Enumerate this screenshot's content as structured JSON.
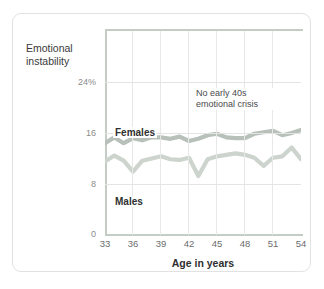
{
  "chart_data": {
    "type": "line",
    "title": "",
    "subtitle": "",
    "xlabel": "Age in years",
    "ylabel": "Emotional\ninstability",
    "ylabel_line1": "Emotional",
    "ylabel_line2": "instability",
    "xlim": [
      33,
      54
    ],
    "ylim": [
      0,
      28
    ],
    "grid": true,
    "legend_position": "inline-labels",
    "x_ticks": [
      33,
      36,
      39,
      42,
      45,
      48,
      51,
      54
    ],
    "x_tick_labels": [
      "33",
      "36",
      "39",
      "42",
      "45",
      "48",
      "51",
      "54"
    ],
    "y_ticks": [
      0,
      8,
      16,
      24
    ],
    "y_tick_labels": [
      "0",
      "8",
      "16",
      "24%"
    ],
    "annotations": [
      {
        "text": "No early 40s\nemotional crisis",
        "line1": "No early 40s",
        "line2": "emotional crisis",
        "x": 45.5,
        "y": 20
      }
    ],
    "x": [
      33,
      34,
      35,
      36,
      37,
      38,
      39,
      40,
      41,
      42,
      43,
      44,
      45,
      46,
      47,
      48,
      49,
      50,
      51,
      52,
      53,
      54
    ],
    "series": [
      {
        "name": "Females",
        "color": "#b7c1ba",
        "values": [
          12.6,
          13.4,
          12.6,
          13.3,
          13.0,
          13.4,
          13.4,
          13.2,
          13.5,
          12.9,
          13.2,
          13.7,
          13.9,
          13.4,
          13.3,
          13.3,
          13.9,
          14.1,
          14.3,
          13.7,
          14.0,
          14.4
        ]
      },
      {
        "name": "Males",
        "color": "#ccd4cd",
        "values": [
          10.1,
          10.9,
          10.2,
          8.7,
          10.2,
          10.5,
          10.8,
          10.4,
          10.3,
          10.6,
          8.1,
          10.4,
          10.8,
          11.0,
          11.2,
          11.0,
          10.6,
          9.5,
          10.6,
          10.8,
          12.0,
          10.4
        ]
      }
    ]
  }
}
